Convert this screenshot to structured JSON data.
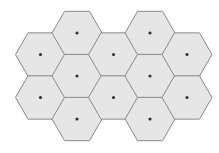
{
  "diagram": {
    "type": "hexagonal-grid",
    "orientation": "flat-top",
    "hex_radius": 25,
    "colors": {
      "background": "#ffffff",
      "fill": "#e6e6e6",
      "stroke": "#8a8a8a",
      "center_dot": "#333333"
    },
    "dot_radius": 1.6,
    "cells": [
      {
        "cx": 40.5,
        "cy": 54.5
      },
      {
        "cx": 40.5,
        "cy": 97.5
      },
      {
        "cx": 77,
        "cy": 33
      },
      {
        "cx": 77,
        "cy": 76
      },
      {
        "cx": 77,
        "cy": 119
      },
      {
        "cx": 113.5,
        "cy": 54.5
      },
      {
        "cx": 113.5,
        "cy": 97.5
      },
      {
        "cx": 150,
        "cy": 33
      },
      {
        "cx": 150,
        "cy": 76
      },
      {
        "cx": 150,
        "cy": 119
      },
      {
        "cx": 187,
        "cy": 54.5
      },
      {
        "cx": 187,
        "cy": 97.5
      }
    ]
  }
}
